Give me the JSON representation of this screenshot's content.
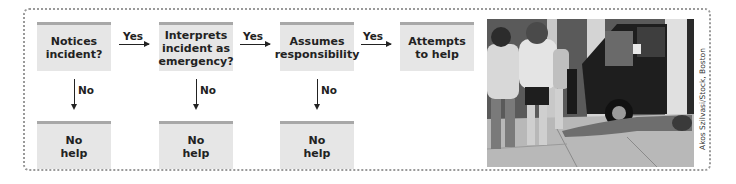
{
  "diagram": {
    "steps": [
      {
        "label": "Notices incident?",
        "lines": [
          "Notices",
          "incident?"
        ]
      },
      {
        "label": "Interprets incident as emergency?",
        "lines": [
          "Interprets",
          "incident as",
          "emergency?"
        ]
      },
      {
        "label": "Assumes responsibility",
        "lines": [
          "Assumes",
          "responsibility"
        ]
      },
      {
        "label": "Attempts to help",
        "lines": [
          "Attempts",
          "to help"
        ]
      }
    ],
    "yes_labels": [
      "Yes",
      "Yes",
      "Yes"
    ],
    "no_labels": [
      "No",
      "No",
      "No"
    ],
    "outcomes": [
      {
        "lines": [
          "No",
          "help"
        ]
      },
      {
        "lines": [
          "No",
          "help"
        ]
      },
      {
        "lines": [
          "No",
          "help"
        ]
      }
    ],
    "colors": {
      "box_fill": "#e6e6e6",
      "box_top_bar": "#a8a8a8",
      "arrow": "#222222",
      "frame_dots": "#9a9a9a"
    }
  },
  "photo": {
    "description": "Pedestrians walking past a person lying on a sidewalk next to a parked van",
    "credit": "Akos Szilvasi/Stock, Boston"
  }
}
